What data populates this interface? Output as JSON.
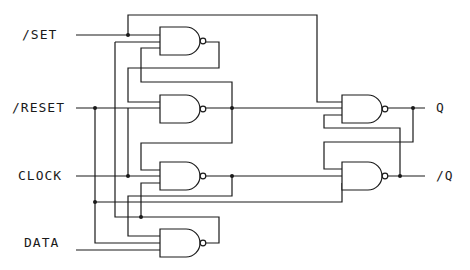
{
  "diagram": {
    "type": "logic-circuit",
    "inputs": [
      {
        "id": "set",
        "label": "/SET"
      },
      {
        "id": "reset",
        "label": "/RESET"
      },
      {
        "id": "clock",
        "label": "CLOCK"
      },
      {
        "id": "data",
        "label": "DATA"
      }
    ],
    "outputs": [
      {
        "id": "q",
        "label": "Q"
      },
      {
        "id": "qbar",
        "label": "/Q"
      }
    ],
    "gates": [
      {
        "id": "g1",
        "type": "NAND3"
      },
      {
        "id": "g2",
        "type": "NAND3"
      },
      {
        "id": "g3",
        "type": "NAND3"
      },
      {
        "id": "g4",
        "type": "NAND3"
      },
      {
        "id": "g5",
        "type": "NAND3"
      },
      {
        "id": "g6",
        "type": "NAND3"
      }
    ],
    "colors": {
      "line": "#1a1a1a",
      "background": "#ffffff"
    }
  }
}
